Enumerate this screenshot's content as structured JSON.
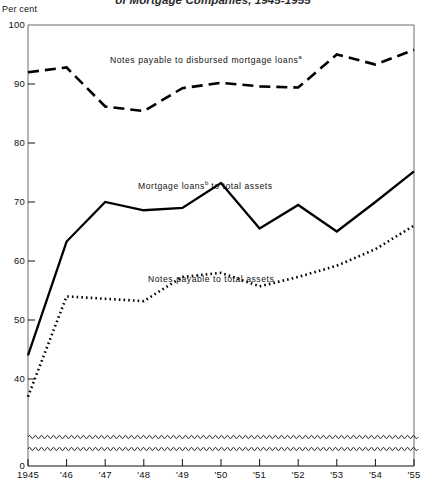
{
  "figure": {
    "title": "of Mortgage Companies, 1945-1955",
    "axis_unit_label": "Per cent"
  },
  "axes": {
    "y_ticks": [
      "100",
      "90",
      "80",
      "70",
      "60",
      "50",
      "40",
      "0"
    ],
    "y_break_note": "axis break between 40 and 0",
    "x_ticks": [
      "1945",
      "'46",
      "'47",
      "'48",
      "'49",
      "'50",
      "'51",
      "'52",
      "'53",
      "'54",
      "'55"
    ]
  },
  "labels": {
    "dashed_series": "Notes payable to disbursed mortgage loans",
    "dashed_series_sup": "a",
    "solid_series_pre": "Mortgage loans",
    "solid_series_sup": "b",
    "solid_series_post": " to total assets",
    "dotted_series": "Notes payable to total assets"
  },
  "colors": {
    "ink": "#000000",
    "background": "#ffffff",
    "frame": "#555555"
  },
  "chart_data": {
    "type": "line",
    "title": "of Mortgage Companies, 1945-1955",
    "xlabel": "",
    "ylabel": "Per cent",
    "ylim": [
      40,
      100
    ],
    "y_axis_break": [
      0,
      40
    ],
    "grid": false,
    "legend": "inline-annotations",
    "x": [
      "1945",
      "1946",
      "1947",
      "1948",
      "1949",
      "1950",
      "1951",
      "1952",
      "1953",
      "1954",
      "1955"
    ],
    "series": [
      {
        "name": "Notes payable to disbursed mortgage loans",
        "style": "dashed",
        "values": [
          92.0,
          92.8,
          86.2,
          85.4,
          89.3,
          90.2,
          89.6,
          89.4,
          95.0,
          93.3,
          95.8
        ]
      },
      {
        "name": "Mortgage loans to total assets",
        "style": "solid",
        "values": [
          44.0,
          63.3,
          70.0,
          68.6,
          69.0,
          73.2,
          65.5,
          69.5,
          65.0,
          70.0,
          75.2
        ]
      },
      {
        "name": "Notes payable to total assets",
        "style": "dotted",
        "values": [
          37.0,
          54.0,
          53.6,
          53.2,
          57.3,
          58.0,
          55.7,
          57.3,
          59.2,
          62.0,
          66.0
        ]
      }
    ]
  }
}
